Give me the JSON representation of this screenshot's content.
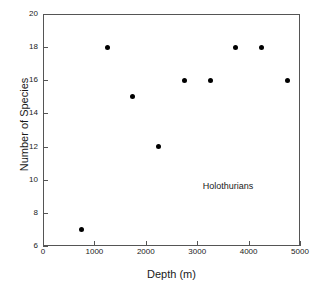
{
  "chart_data": {
    "type": "scatter",
    "title": "",
    "xlabel": "Depth (m)",
    "ylabel": "Number of Species",
    "xlim": [
      0,
      5000
    ],
    "ylim": [
      6,
      20
    ],
    "grid": false,
    "legend_position": "none",
    "xticks": [
      0,
      1000,
      2000,
      3000,
      4000,
      5000
    ],
    "xtick_labels": [
      "0",
      "1000",
      "2000",
      "3000",
      "4000",
      "5000"
    ],
    "yticks": [
      6,
      8,
      10,
      12,
      14,
      16,
      18,
      20
    ],
    "ytick_labels": [
      "6",
      "8",
      "10",
      "12",
      "14",
      "16",
      "18",
      "20"
    ],
    "marker_color": "#000000",
    "series": [
      {
        "name": "Holothurians",
        "x": [
          750,
          1250,
          1750,
          2250,
          2750,
          3250,
          3750,
          4250,
          4750
        ],
        "values": [
          7,
          18,
          15,
          12,
          16,
          16,
          18,
          18,
          16
        ]
      }
    ],
    "annotations": [
      {
        "text": "Holothurians",
        "x": 3600,
        "y": 9.6
      }
    ]
  }
}
